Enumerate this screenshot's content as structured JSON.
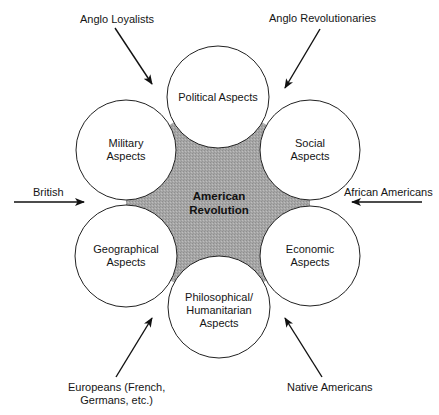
{
  "diagram": {
    "center": {
      "line1": "American",
      "line2": "Revolution",
      "fill_color": "#a9a9a9"
    },
    "aspects": [
      {
        "id": "political",
        "lines": [
          "Political Aspects"
        ]
      },
      {
        "id": "social",
        "lines": [
          "Social",
          "Aspects"
        ]
      },
      {
        "id": "economic",
        "lines": [
          "Economic",
          "Aspects"
        ]
      },
      {
        "id": "philosophical",
        "lines": [
          "Philosophical/",
          "Humanitarian",
          "Aspects"
        ]
      },
      {
        "id": "geographical",
        "lines": [
          "Geographical",
          "Aspects"
        ]
      },
      {
        "id": "military",
        "lines": [
          "Military",
          "Aspects"
        ]
      }
    ],
    "influences": [
      {
        "id": "anglo-loyalists",
        "lines": [
          "Anglo Loyalists"
        ]
      },
      {
        "id": "anglo-revolutionaries",
        "lines": [
          "Anglo Revolutionaries"
        ]
      },
      {
        "id": "british",
        "lines": [
          "British"
        ]
      },
      {
        "id": "african-americans",
        "lines": [
          "African Americans"
        ]
      },
      {
        "id": "europeans",
        "lines": [
          "Europeans (French,",
          "Germans, etc.)"
        ]
      },
      {
        "id": "native-americans",
        "lines": [
          "Native Americans"
        ]
      }
    ]
  }
}
